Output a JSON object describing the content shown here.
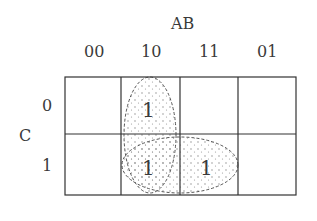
{
  "kmap": {
    "title_var": "AB",
    "row_var": "C",
    "col_headers": [
      "00",
      "10",
      "11",
      "01"
    ],
    "row_headers": [
      "0",
      "1"
    ],
    "cells": [
      [
        "",
        "1",
        "",
        ""
      ],
      [
        "",
        "1",
        "1",
        ""
      ]
    ],
    "groups": [
      {
        "name": "vertical-group",
        "cells": [
          [
            0,
            1
          ],
          [
            1,
            1
          ]
        ]
      },
      {
        "name": "horizontal-group",
        "cells": [
          [
            1,
            1
          ],
          [
            1,
            2
          ]
        ]
      }
    ]
  }
}
